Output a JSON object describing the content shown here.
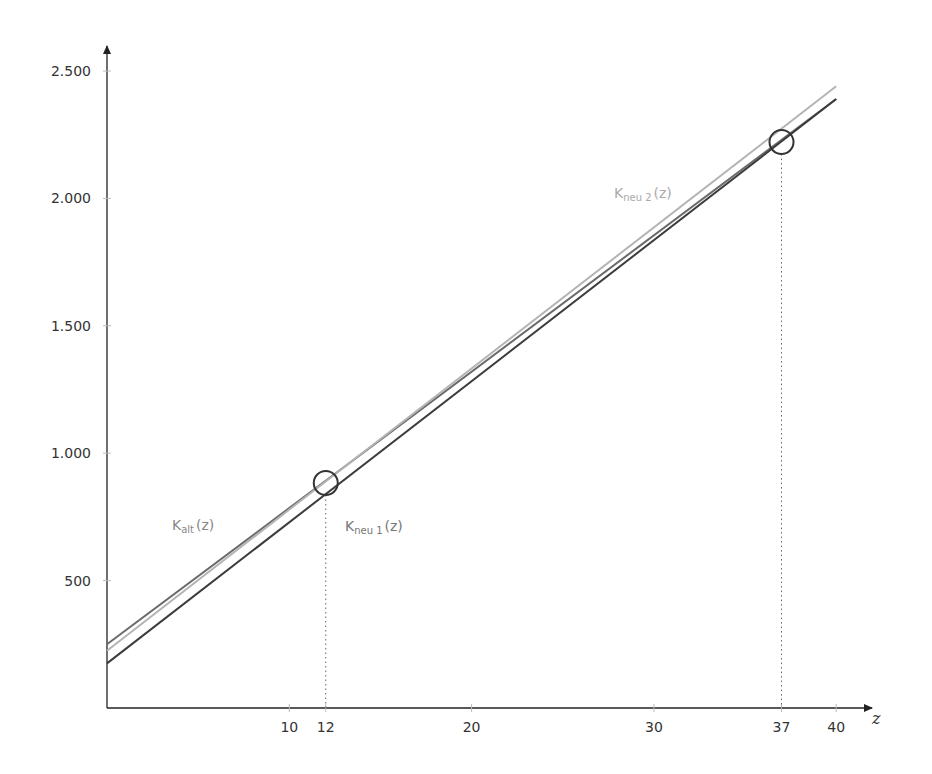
{
  "chart_data": {
    "type": "line",
    "title": "",
    "xlabel": "z",
    "ylabel": "",
    "xlim": [
      0,
      42
    ],
    "ylim": [
      0,
      2600
    ],
    "grid": false,
    "x_ticks": [
      10,
      12,
      20,
      30,
      37,
      40
    ],
    "x_tick_labels": [
      "10",
      "12",
      "20",
      "30",
      "37",
      "40"
    ],
    "y_ticks": [
      500,
      1000,
      1500,
      2000,
      2500
    ],
    "y_tick_labels": [
      "500",
      "1.000",
      "1.500",
      "2.000",
      "2.500"
    ],
    "series": [
      {
        "name": "K_alt(z)",
        "label_main": "K",
        "label_sub": "alt",
        "label_suffix": "(z)",
        "color": "#6a6a6a",
        "x": [
          0,
          40
        ],
        "values": [
          250,
          2390
        ]
      },
      {
        "name": "K_neu1(z)",
        "label_main": "K",
        "label_sub": "neu 1",
        "label_suffix": "(z)",
        "color": "#3c3c3c",
        "x": [
          0,
          40
        ],
        "values": [
          175,
          2390
        ]
      },
      {
        "name": "K_neu2(z)",
        "label_main": "K",
        "label_sub": "neu 2",
        "label_suffix": "(z)",
        "color": "#b4b4b4",
        "x": [
          0,
          40
        ],
        "values": [
          225,
          2440
        ]
      }
    ],
    "annotations": [
      {
        "type": "circle",
        "x": 12,
        "y": 883,
        "dotted_drop_line": true
      },
      {
        "type": "circle",
        "x": 37,
        "y": 2221,
        "dotted_drop_line": true
      }
    ]
  }
}
